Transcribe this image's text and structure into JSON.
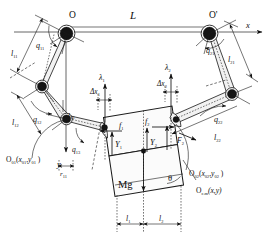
{
  "figure": {
    "background_color": "#ffffff",
    "line_color": "#111111",
    "link_fill_color": "#f2f2f2",
    "body_fill_color": "#fbfbfb"
  },
  "axes": {
    "x_label": "x",
    "y_label": "y",
    "origin_label": "O",
    "origin2_label": "O'",
    "span_label": "L"
  },
  "left_arm": {
    "base_label": "O",
    "link1_length_label": "l11",
    "link1_length_text": "l",
    "link1_length_sub": "11",
    "joint1_angle_text": "q",
    "joint1_angle_sub": "11",
    "link2_length_text": "l",
    "link2_length_sub": "12",
    "joint2_angle_text": "q",
    "joint2_angle_sub": "12",
    "link3_length_text": "l",
    "link3_length_sub": "13",
    "joint3_angle_text": "q",
    "joint3_angle_sub": "13",
    "base_frame_text": "O",
    "base_frame_sub": "01",
    "base_frame_coords": "(x01 , y01 )",
    "base_frame_coord_x": "x",
    "base_frame_coord_x_sub": "01",
    "base_frame_coord_y": "y",
    "base_frame_coord_y_sub": "01"
  },
  "right_arm": {
    "base_label": "O'",
    "link1_length_text": "l",
    "link1_length_sub": "21",
    "joint1_angle_text": "q",
    "joint1_angle_sub": "21",
    "link2_length_text": "l",
    "link2_length_sub": "22",
    "joint2_angle_text": "q",
    "joint2_angle_sub": "22",
    "base_frame_text": "O",
    "base_frame_sub": "02",
    "base_frame_coord_x": "x",
    "base_frame_coord_x_sub": "02",
    "base_frame_coord_y": "y",
    "base_frame_coord_y_sub": "02"
  },
  "payload": {
    "center_frame_text": "O",
    "center_frame_sub": "c.m",
    "center_frame_coords": "(x,y)",
    "weight_label": "Mg",
    "tilt_angle_label": "θ",
    "half_width_left_text": "l",
    "half_width_left_sub": "1",
    "half_width_right_text": "l",
    "half_width_right_sub": "2"
  },
  "forces": {
    "lambda1_text": "λ",
    "lambda1_sub": "1",
    "lambda2_text": "λ",
    "lambda2_sub": "2",
    "delta_x1_text": "Δx",
    "delta_x1_sub": "1",
    "delta_x2_text": "Δx",
    "delta_x2_sub": "2",
    "f1_text": "f",
    "f1_sub": "1",
    "f2_text": "f",
    "f2_sub": "2",
    "Y1_text": "Y",
    "Y1_sub": "1",
    "Y2_text": "Y",
    "Y2_sub": "2",
    "F2_text": "F",
    "F2_sub": "2",
    "r11_text": "r",
    "r11_sub": "11"
  }
}
